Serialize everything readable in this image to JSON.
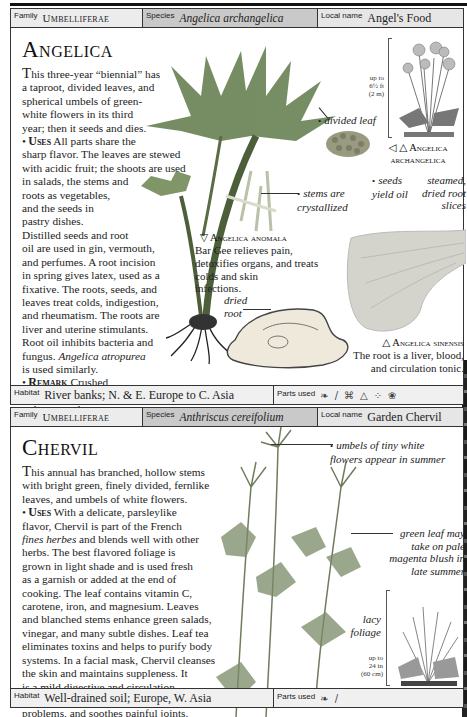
{
  "entries": [
    {
      "header": {
        "family_label": "Family",
        "family": "Umbelliferae",
        "species_label": "Species",
        "species": "Angelica archangelica",
        "local_label": "Local name",
        "local": "Angel's Food"
      },
      "title": "Angelica",
      "intro_dropcap": "T",
      "intro": "his three-year “biennial” has\na taproot, divided leaves, and\nspherical umbels of green-\nwhite flowers in its third\nyear; then it seeds and dies.",
      "uses_label": "Uses",
      "uses_text": " All parts share the\nsharp flavor. The leaves are stewed\nwith acidic fruit; the shoots are used\nin salads, the stems and\nroots as vegetables,\nand the seeds in\npastry dishes.\nDistilled seeds and root\noil are used in gin, vermouth,\nand perfumes. A root incision\nin spring gives latex, used as a\nfixative. The roots, seeds, and\nleaves treat colds, indigestion,\nand rheumatism. The roots are\nliver and uterine stimulants.\nRoot oil inhibits bacteria and\nfungus. ",
      "uses_italic": "Angelica atropurea",
      "uses_tail": "\nis used similarly.",
      "remark_label": "Remark",
      "remark_text": " Crushed\nleaves in car interiors\nreduce travel nausea.",
      "captions": {
        "divided_leaf": "divided leaf",
        "stems": "stems are\ncrystallized",
        "seeds": "seeds\nyield oil",
        "steamed": "steamed,\ndried root\nslices",
        "dried_root": "dried\nroot"
      },
      "scale": "up to\n6½ ft\n(2 m)",
      "illustration_label": "◁ △ Angelica\narchangelica",
      "anomala": {
        "name": "▽ Angelica anomala",
        "desc": "Bar Gee relieves pain,\ndetoxifies organs, and treats\ncolds and skin\ninfections."
      },
      "sinensis": {
        "name": "△ Angelica sinensis",
        "desc": "The root is a liver, blood,\nand circulation tonic."
      },
      "footer": {
        "habitat_label": "Habitat",
        "habitat": "River banks; N. & E. Europe to C. Asia",
        "parts_label": "Parts used",
        "parts_icons": [
          "leaf-icon",
          "stem-icon",
          "root-icon",
          "oil-icon",
          "seeds-icon",
          "flower-icon"
        ]
      }
    },
    {
      "header": {
        "family_label": "Family",
        "family": "Umbelliferae",
        "species_label": "Species",
        "species": "Anthriscus cereifolium",
        "local_label": "Local name",
        "local": "Garden Chervil"
      },
      "title": "Chervil",
      "intro_dropcap": "T",
      "intro": "his annual has branched, hollow stems\nwith bright green, finely divided, fernlike\nleaves, and umbels of white flowers.",
      "uses_label": "Uses",
      "uses_text": " With a delicate, parsleylike\nflavor, Chervil is part of the French\n",
      "uses_italic": "fines herbes",
      "uses_tail": " and blends well with other\nherbs. The best flavored foliage is\ngrown in light shade and is used fresh\nas a garnish or added at the end of\ncooking. The leaf contains vitamin C,\ncarotene, iron, and magnesium. Leaves\nand blanched stems enhance green salads,\nvinegar, and many subtle dishes. Leaf tea\neliminates toxins and helps to purify body\nsystems. In a facial mask, Chervil cleanses\nthe skin and maintains suppleness. It\nis a mild digestive and circulation\nstimulant, reduces phlegm and liver\nproblems, and soothes painful joints.",
      "captions": {
        "umbels": "umbels of tiny white\nflowers appear in summer",
        "green_leaf": "green leaf may\ntake on pale\nmagenta blush in\nlate summer",
        "lacy": "lacy\nfoliage"
      },
      "scale": "up to\n24 in\n(60 cm)",
      "footer": {
        "habitat_label": "Habitat",
        "habitat": "Well-drained soil; Europe, W. Asia",
        "parts_label": "Parts used",
        "parts_icons": [
          "leaf-icon",
          "stem-icon"
        ]
      }
    }
  ],
  "icon_glyphs": {
    "leaf-icon": "❧",
    "stem-icon": "/",
    "root-icon": "⌘",
    "oil-icon": "△",
    "seeds-icon": "⁘",
    "flower-icon": "❀"
  }
}
